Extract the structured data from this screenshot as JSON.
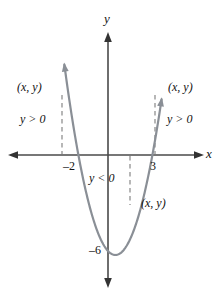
{
  "figure": {
    "kind": "cartesian-graph",
    "width": 223,
    "height": 297,
    "background": "#ffffff"
  },
  "axes": {
    "x_label": "x",
    "y_label": "y",
    "x_axis_color": "#4a4a4a",
    "y_axis_color": "#4a4a4a",
    "origin_px": {
      "x": 108,
      "y": 155
    },
    "px_per_unit_x": 14.8,
    "px_per_unit_y": 16.0,
    "x_range_px": [
      8,
      204
    ],
    "y_range_px": [
      32,
      288
    ],
    "grid": false
  },
  "tick_labels": [
    {
      "text": "–2",
      "value": -2,
      "axis": "x"
    },
    {
      "text": "3",
      "value": 3,
      "axis": "x"
    },
    {
      "text": "–6",
      "value": -6,
      "axis": "y"
    }
  ],
  "annotations": {
    "point_labels": [
      {
        "id": "left",
        "text": "(x, y)"
      },
      {
        "id": "right",
        "text": "(x, y)"
      },
      {
        "id": "bottom",
        "text": "(x, y)"
      }
    ],
    "sign_labels": [
      {
        "id": "left",
        "text": "y > 0"
      },
      {
        "id": "right",
        "text": "y > 0"
      },
      {
        "id": "middle",
        "text": "y < 0"
      }
    ]
  },
  "chart_data": {
    "type": "line",
    "title": "",
    "subtitle": "",
    "xlabel": "x",
    "ylabel": "y",
    "curve_label": "y = x² − x − 6",
    "curve_color": "#8a8f96",
    "xlim": [
      -6.8,
      6.5
    ],
    "ylim": [
      -7.7,
      7.7
    ],
    "grid": false,
    "legend": "none",
    "roots": [
      -2,
      3
    ],
    "vertex": {
      "x": 0.5,
      "y": -6.25
    },
    "y_intercept": -6,
    "marked_y_value_label": "–6",
    "x": [
      -2.8,
      -2.5,
      -2.2,
      -2.0,
      -1.6,
      -1.2,
      -0.8,
      -0.4,
      0.0,
      0.5,
      1.0,
      1.4,
      1.8,
      2.2,
      2.6,
      3.0,
      3.4,
      3.8
    ],
    "values": [
      3.64,
      2.75,
      1.04,
      0.0,
      -1.84,
      -3.36,
      -4.56,
      -5.44,
      -6.0,
      -6.25,
      -6.0,
      -5.44,
      -4.56,
      -3.36,
      -1.84,
      0.0,
      2.16,
      4.04
    ],
    "series": [
      {
        "name": "parabola",
        "expression": "x^2 - x - 6",
        "arrows": [
          "start",
          "end"
        ]
      }
    ],
    "dashed_segments": [
      {
        "id": "left",
        "x": -3.1,
        "from_y": 0,
        "to_y": 5.9,
        "note": "y > 0 region left of x = -2"
      },
      {
        "id": "middle",
        "x": 1.5,
        "from_y": 0,
        "to_y": -3.1,
        "note": "y < 0 region between roots"
      },
      {
        "id": "right",
        "x": 3.2,
        "from_y": 0,
        "to_y": 5.9,
        "note": "y > 0 region right of x = 3"
      }
    ]
  }
}
